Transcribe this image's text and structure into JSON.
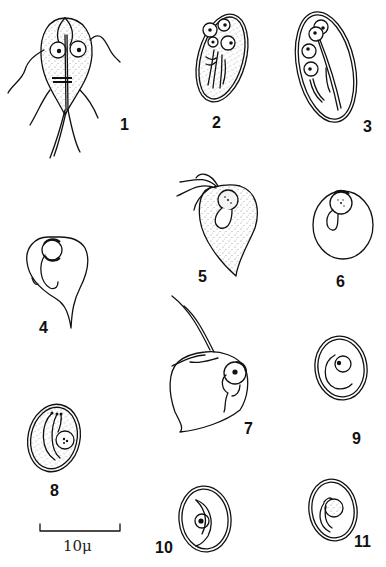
{
  "plate": {
    "type": "scientific illustration plate",
    "background": "#ffffff",
    "ink_color": "#111111",
    "figures": [
      {
        "number": "1",
        "label": "1",
        "description": "trophozoite, ventral view, two nuclei, four pairs of flagella, stippled"
      },
      {
        "number": "2",
        "label": "2",
        "description": "mature cyst, four nuclei, axonemes, stippled"
      },
      {
        "number": "3",
        "label": "3",
        "description": "mature cyst, four nuclei, double wall, clear"
      },
      {
        "number": "4",
        "label": "4",
        "description": "rounded trophozoite with tail, nucleus at top"
      },
      {
        "number": "5",
        "label": "5",
        "description": "pear-shaped trophozoite with flagella, stippled"
      },
      {
        "number": "6",
        "label": "6",
        "description": "round form with nucleus at top"
      },
      {
        "number": "7",
        "label": "7",
        "description": "trophozoite with long flagella, nucleus at right"
      },
      {
        "number": "8",
        "label": "8",
        "description": "cyst with fibrils and nucleus, stippled"
      },
      {
        "number": "9",
        "label": "9",
        "description": "oval cyst, double wall, single nucleus"
      },
      {
        "number": "10",
        "label": "10",
        "description": "cyst, double wall, nucleus with crescent"
      },
      {
        "number": "11",
        "label": "11",
        "description": "cyst, double wall, granular nucleus"
      }
    ],
    "scale_bar": {
      "label": "10μ",
      "length_px": 80
    }
  }
}
